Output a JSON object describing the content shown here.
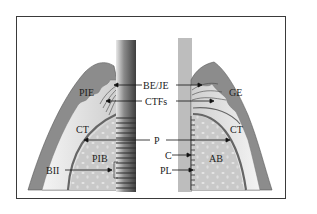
{
  "diagram": {
    "left_side": "implant",
    "right_side": "natural tooth",
    "labels": {
      "pie": "PIE",
      "be_je": "BE/JE",
      "ctfs": "CTFs",
      "ge": "GE",
      "ct_left": "CT",
      "ct_right": "CT",
      "p": "P",
      "pib": "PIB",
      "ab": "AB",
      "c": "C",
      "bii": "BII",
      "pl": "PL"
    },
    "colors": {
      "epithelium": "#8a8a8a",
      "connective_tissue": "#d4d4d4",
      "periosteum": "#6e6e6e",
      "bone": "#c8c8c8",
      "implant_dark": "#6a6a6a",
      "tooth_root": "#bdbdbd",
      "frame": "#3a3a3a"
    }
  }
}
